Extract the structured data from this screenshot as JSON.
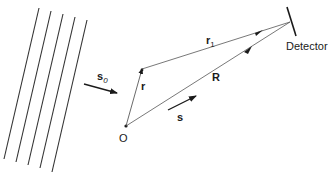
{
  "diagram": {
    "type": "scattering-geometry",
    "labels": {
      "incident_vector": "s",
      "incident_subscript": "0",
      "origin": "O",
      "position_vector": "r",
      "path_vector": "r",
      "path_subscript": "1",
      "detector_vector": "R",
      "scattered_vector": "s",
      "detector": "Detector"
    },
    "wavefronts": {
      "count": 5
    },
    "colors": {
      "stroke": "#2a2a2a",
      "text": "#1a1a1a",
      "background": "#ffffff"
    }
  }
}
